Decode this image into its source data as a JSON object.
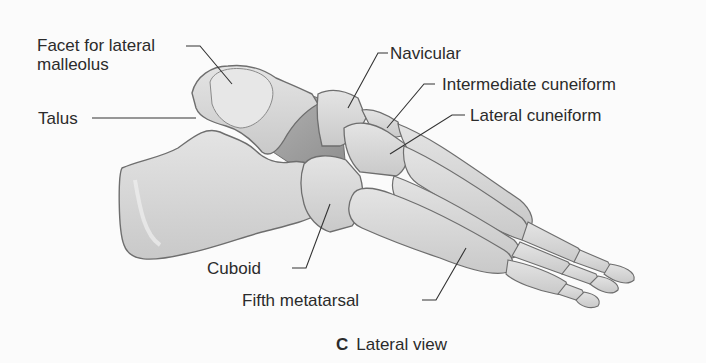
{
  "figure": {
    "panel_letter": "C",
    "caption": "Lateral view",
    "labels": {
      "facet_line1": "Facet for lateral",
      "facet_line2": "malleolus",
      "talus": "Talus",
      "navicular": "Navicular",
      "intermediate_cuneiform": "Intermediate cuneiform",
      "lateral_cuneiform": "Lateral cuneiform",
      "cuboid": "Cuboid",
      "fifth_metatarsal": "Fifth metatarsal"
    },
    "colors": {
      "bone_fill": "#d6d6d6",
      "bone_light": "#e6e6e6",
      "bone_shadow": "#9a9a9a",
      "outline": "#6e6e6e",
      "leader": "#333333",
      "text": "#2b2b2b"
    }
  }
}
